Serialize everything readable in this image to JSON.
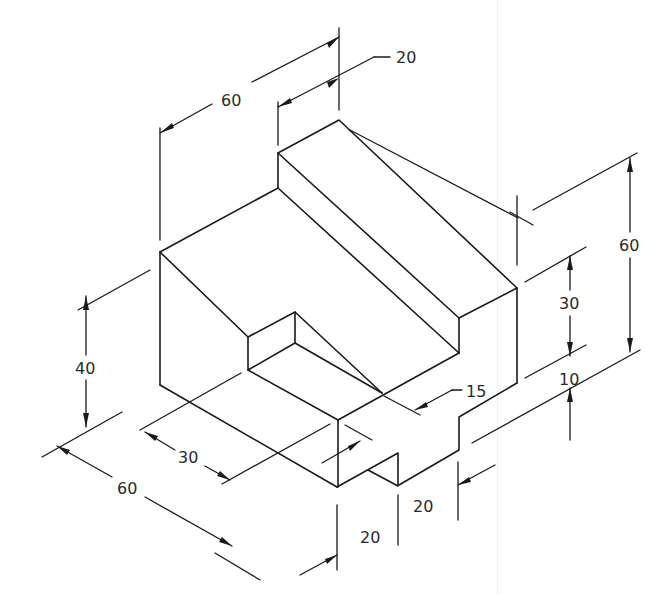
{
  "drawing": {
    "type": "isometric technical drawing",
    "line_color": "#1a1a1a",
    "background": "#ffffff"
  },
  "dimensions": {
    "top_width": "60",
    "top_ridge": "20",
    "right_total_height": "60",
    "right_upper_height": "30",
    "right_step": "10",
    "left_height": "40",
    "front_depth_30": "30",
    "front_depth_60": "60",
    "slot_depth": "15",
    "notch_width_front": "20",
    "notch_width_right": "20"
  }
}
